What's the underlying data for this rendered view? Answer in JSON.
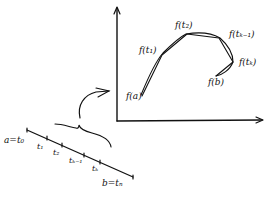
{
  "diagram": {
    "stroke_color": "#111111",
    "background": "#ffffff",
    "curve_labels": [
      "f(a)",
      "f(t₁)",
      "f(t₂)",
      "f(tₖ₋₁)",
      "f(tₖ)",
      "f(b)"
    ],
    "interval_labels": {
      "start": "a=t₀",
      "t1": "t₁",
      "t2": "t₂",
      "tk_minus_1": "tₖ₋₁",
      "tk": "tₖ",
      "end": "b=tₙ"
    }
  }
}
